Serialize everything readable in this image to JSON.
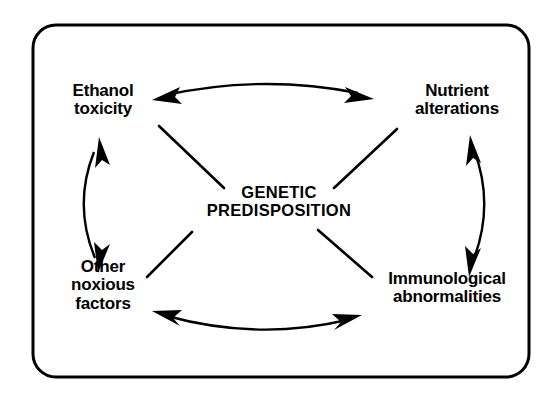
{
  "figure": {
    "frame": {
      "shape": "rounded-rectangle",
      "border_color": "#000000",
      "background_color": "#ffffff"
    },
    "center_node": {
      "id": "genetic-predisposition",
      "label": "GENETIC\nPREDISPOSITION"
    },
    "nodes": [
      {
        "id": "ethanol-toxicity",
        "label": "Ethanol\ntoxicity",
        "position": "top-left"
      },
      {
        "id": "nutrient-alterations",
        "label": "Nutrient\nalterations",
        "position": "top-right"
      },
      {
        "id": "other-noxious-factors",
        "label": "Other\nnoxious\nfactors",
        "position": "bottom-left"
      },
      {
        "id": "immunological-abnormalities",
        "label": "Immunological\nabnormalities",
        "position": "bottom-right"
      }
    ],
    "connectors": {
      "spokes": [
        {
          "id": "spoke-center-to-ethanol-toxicity",
          "from": "genetic-predisposition",
          "to": "ethanol-toxicity",
          "style": "straight-line",
          "arrowheads": "none"
        },
        {
          "id": "spoke-center-to-nutrient-alterations",
          "from": "genetic-predisposition",
          "to": "nutrient-alterations",
          "style": "straight-line",
          "arrowheads": "none"
        },
        {
          "id": "spoke-center-to-other-noxious-factors",
          "from": "genetic-predisposition",
          "to": "other-noxious-factors",
          "style": "straight-line",
          "arrowheads": "none"
        },
        {
          "id": "spoke-center-to-immunological-abnormalities",
          "from": "genetic-predisposition",
          "to": "immunological-abnormalities",
          "style": "straight-line",
          "arrowheads": "none"
        }
      ],
      "arcs": [
        {
          "id": "arc-ethanol-toxicity-nutrient-alterations",
          "between": [
            "ethanol-toxicity",
            "nutrient-alterations"
          ],
          "style": "curved",
          "bow": "up",
          "arrowheads": "both"
        },
        {
          "id": "arc-nutrient-alterations-immunological-abnormalities",
          "between": [
            "nutrient-alterations",
            "immunological-abnormalities"
          ],
          "style": "curved",
          "bow": "right",
          "arrowheads": "both"
        },
        {
          "id": "arc-other-noxious-factors-immunological-abnormalities",
          "between": [
            "other-noxious-factors",
            "immunological-abnormalities"
          ],
          "style": "curved",
          "bow": "down",
          "arrowheads": "both"
        },
        {
          "id": "arc-ethanol-toxicity-other-noxious-factors",
          "between": [
            "ethanol-toxicity",
            "other-noxious-factors"
          ],
          "style": "curved",
          "bow": "left",
          "arrowheads": "both"
        }
      ]
    }
  }
}
